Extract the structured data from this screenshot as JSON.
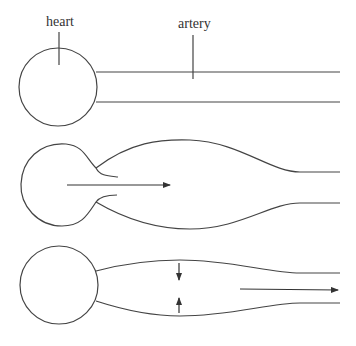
{
  "diagram": {
    "labels": {
      "heart": "heart",
      "artery": "artery"
    },
    "panels": [
      {
        "name": "resting",
        "description": "Heart connected to straight, uniform-width artery"
      },
      {
        "name": "ejection",
        "description": "Heart contracts, blood flows into expanding artery (arrow to the right)"
      },
      {
        "name": "recoil",
        "description": "Artery walls recoil inward (vertical arrows), pushing blood onward (arrow to the right)"
      }
    ],
    "colors": {
      "stroke": "#444444",
      "text": "#333333",
      "background": "#ffffff"
    }
  }
}
